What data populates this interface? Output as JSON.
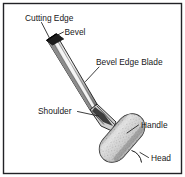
{
  "figure": {
    "background_color": "#ffffff",
    "border_color": "#222226",
    "labels": [
      {
        "id": "cutting-edge",
        "text": "Cutting Edge"
      },
      {
        "id": "bevel",
        "text": "Bevel"
      },
      {
        "id": "bevel-edge-blade",
        "text": "Bevel Edge Blade"
      },
      {
        "id": "shoulder",
        "text": "Shoulder"
      },
      {
        "id": "handle",
        "text": "Handle"
      },
      {
        "id": "head",
        "text": "Head"
      }
    ],
    "parts": {
      "blade_color": "#b4b4b4",
      "blade_highlight_color": "#f2f2f2",
      "blade_shadow_color": "#6e6e6e",
      "bevel_tip_color": "#1c1c1c",
      "handle_color": "#d2d2d2",
      "outline_color": "#1a1a1a",
      "leader_color": "#1a1a1a"
    }
  }
}
